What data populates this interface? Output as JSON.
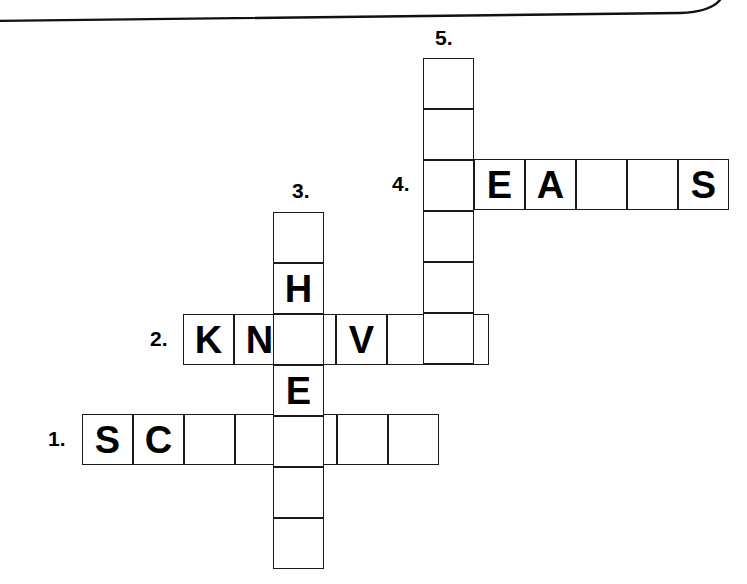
{
  "page": {
    "background_color": "#ffffff",
    "ink_color": "#000000",
    "cell_border_color": "#1a1a1a",
    "cell_size": 51
  },
  "decoration": {
    "top_border_label": "rounded-page-edge-line",
    "visible": true
  },
  "puzzle": {
    "title": "crossword-grid",
    "entries": [
      {
        "number": "1.",
        "direction": "across",
        "label_x": 48,
        "label_y": 428,
        "origin_x": 82,
        "origin_y": 414,
        "length": 7,
        "letters": [
          "S",
          "C",
          "",
          "",
          "",
          "",
          ""
        ]
      },
      {
        "number": "2.",
        "direction": "across",
        "label_x": 150,
        "label_y": 328,
        "origin_x": 183,
        "origin_y": 314,
        "length": 6,
        "letters": [
          "K",
          "N",
          "",
          "V",
          "",
          ""
        ]
      },
      {
        "number": "3.",
        "direction": "down",
        "label_x": 292,
        "label_y": 180,
        "origin_x": 273,
        "origin_y": 212,
        "length": 7,
        "letters": [
          "",
          "H",
          "",
          "E",
          "",
          "",
          ""
        ]
      },
      {
        "number": "4.",
        "direction": "across",
        "label_x": 392,
        "label_y": 173,
        "origin_x": 423,
        "origin_y": 159,
        "length": 6,
        "letters": [
          "",
          "E",
          "A",
          "",
          "",
          "S"
        ]
      },
      {
        "number": "5.",
        "direction": "down",
        "label_x": 435,
        "label_y": 27,
        "origin_x": 423,
        "origin_y": 58,
        "length": 6,
        "letters": [
          "",
          "",
          "",
          "",
          "",
          ""
        ]
      }
    ]
  }
}
